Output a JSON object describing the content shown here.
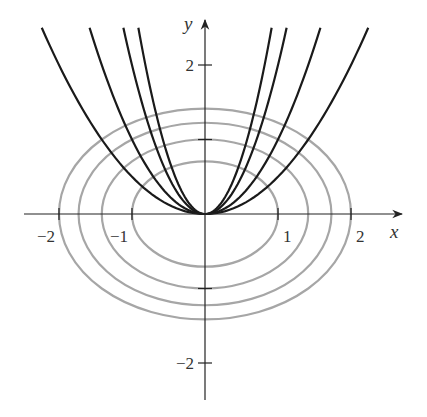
{
  "chart_data": {
    "type": "line",
    "title": "",
    "xlabel": "x",
    "ylabel": "y",
    "xlim": [
      -2.4,
      2.7
    ],
    "ylim": [
      -2.5,
      2.6
    ],
    "grid": false,
    "x_ticks": [
      {
        "value": -2,
        "label": "−2"
      },
      {
        "value": -1,
        "label": "−1"
      },
      {
        "value": 1,
        "label": "1"
      },
      {
        "value": 2,
        "label": "2"
      }
    ],
    "y_ticks": [
      {
        "value": 2,
        "label": "2"
      },
      {
        "value": 1,
        "label": ""
      },
      {
        "value": -1,
        "label": ""
      },
      {
        "value": -2,
        "label": "−2"
      }
    ],
    "series": [
      {
        "name": "ellipse x^2+2y^2=1",
        "kind": "ellipse",
        "color": "#a6a6a6",
        "a": 1.0,
        "b": 0.707
      },
      {
        "name": "ellipse x^2+2y^2=2",
        "kind": "ellipse",
        "color": "#a6a6a6",
        "a": 1.414,
        "b": 1.0
      },
      {
        "name": "ellipse x^2+2y^2=3",
        "kind": "ellipse",
        "color": "#a6a6a6",
        "a": 1.732,
        "b": 1.225
      },
      {
        "name": "ellipse x^2+2y^2=4",
        "kind": "ellipse",
        "color": "#a6a6a6",
        "a": 2.0,
        "b": 1.414
      },
      {
        "name": "parabola y=0.5x^2",
        "kind": "parabola",
        "color": "#1a1a1a",
        "k": 0.5
      },
      {
        "name": "parabola y=x^2",
        "kind": "parabola",
        "color": "#1a1a1a",
        "k": 1
      },
      {
        "name": "parabola y=2x^2",
        "kind": "parabola",
        "color": "#1a1a1a",
        "k": 2
      },
      {
        "name": "parabola y=3x^2",
        "kind": "parabola",
        "color": "#1a1a1a",
        "k": 3
      }
    ],
    "parabola_ymax": 2.5
  }
}
